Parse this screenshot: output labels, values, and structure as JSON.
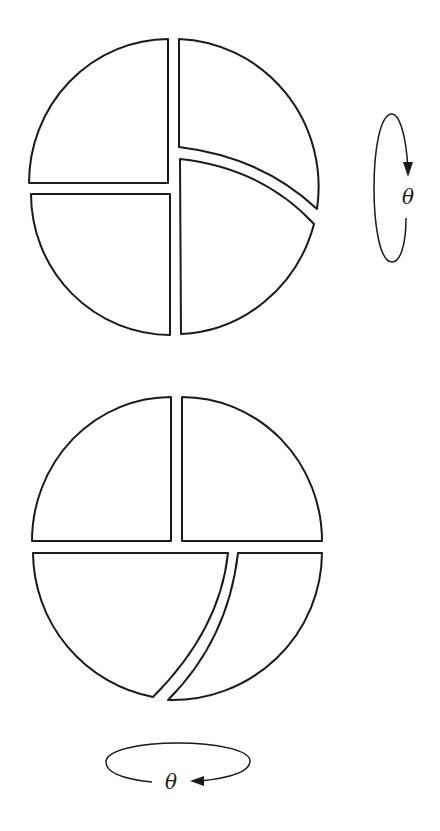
{
  "diagram": {
    "colors": {
      "stroke": "#1a1a1a",
      "fill": "#ffffff",
      "background": "#ffffff"
    },
    "top_figure": {
      "name": "top-disc",
      "piece_count": 4,
      "pieces": [
        "upper-left-quadrant",
        "upper-right-sector",
        "lower-left-quadrant",
        "lower-right-sector"
      ],
      "rotation": {
        "axis": "vertical",
        "direction": "downward on front side",
        "label": "θ",
        "icon": "vertical-rotation-arrow-icon"
      }
    },
    "bottom_figure": {
      "name": "bottom-disc",
      "piece_count": 4,
      "pieces": [
        "upper-left-quadrant",
        "upper-right-quadrant",
        "lower-left-sector",
        "lower-right-sector"
      ],
      "rotation": {
        "axis": "horizontal",
        "direction": "leftward on front side",
        "label": "θ",
        "icon": "horizontal-rotation-arrow-icon"
      }
    }
  }
}
